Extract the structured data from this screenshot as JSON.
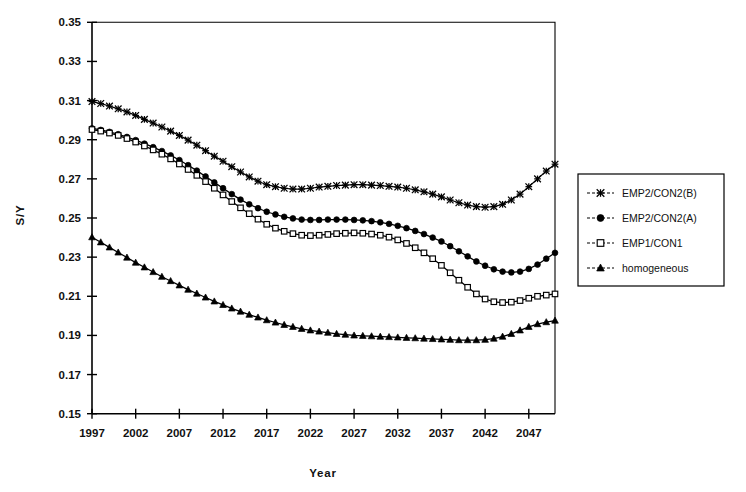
{
  "chart_data": {
    "type": "line",
    "title": "",
    "xlabel": "Year",
    "ylabel": "S/Y",
    "xlim": [
      1997,
      2050
    ],
    "ylim": [
      0.15,
      0.35
    ],
    "ytick_step": 0.02,
    "xtick_step": 5,
    "grid": false,
    "legend_position": "right",
    "xticks": [
      1997,
      2002,
      2007,
      2012,
      2017,
      2022,
      2027,
      2032,
      2037,
      2042,
      2047
    ],
    "xtick_labels": [
      "1997",
      "2002",
      "2007",
      "2012",
      "2017",
      "2022",
      "2027",
      "2032",
      "2037",
      "2042",
      "2047"
    ],
    "yticks": [
      0.15,
      0.17,
      0.19,
      0.21,
      0.23,
      0.25,
      0.27,
      0.29,
      0.31,
      0.33,
      0.35
    ],
    "ytick_labels": [
      "0.15",
      "0.17",
      "0.19",
      "0.21",
      "0.23",
      "0.25",
      "0.27",
      "0.29",
      "0.31",
      "0.33",
      "0.35"
    ],
    "x": [
      1997,
      1998,
      1999,
      2000,
      2001,
      2002,
      2003,
      2004,
      2005,
      2006,
      2007,
      2008,
      2009,
      2010,
      2011,
      2012,
      2013,
      2014,
      2015,
      2016,
      2017,
      2018,
      2019,
      2020,
      2021,
      2022,
      2023,
      2024,
      2025,
      2026,
      2027,
      2028,
      2029,
      2030,
      2031,
      2032,
      2033,
      2034,
      2035,
      2036,
      2037,
      2038,
      2039,
      2040,
      2041,
      2042,
      2043,
      2044,
      2045,
      2046,
      2047,
      2048,
      2049,
      2050
    ],
    "series": [
      {
        "name": "EMP2/CON2(B)",
        "marker": "cross",
        "values": [
          0.3095,
          0.3085,
          0.3072,
          0.3058,
          0.3042,
          0.3024,
          0.3004,
          0.2985,
          0.2965,
          0.2944,
          0.2922,
          0.2898,
          0.2872,
          0.2844,
          0.2816,
          0.279,
          0.2762,
          0.2735,
          0.271,
          0.2688,
          0.267,
          0.266,
          0.2652,
          0.2648,
          0.2648,
          0.2652,
          0.2658,
          0.2662,
          0.2666,
          0.2668,
          0.267,
          0.267,
          0.2668,
          0.2666,
          0.2662,
          0.2658,
          0.2652,
          0.2644,
          0.2634,
          0.2622,
          0.2608,
          0.2592,
          0.2578,
          0.2566,
          0.2558,
          0.2555,
          0.2558,
          0.257,
          0.2592,
          0.2622,
          0.266,
          0.27,
          0.274,
          0.2775
        ]
      },
      {
        "name": "EMP2/CON2(A)",
        "marker": "circle",
        "values": [
          0.2958,
          0.295,
          0.294,
          0.2928,
          0.2914,
          0.2898,
          0.288,
          0.2862,
          0.2842,
          0.282,
          0.2796,
          0.277,
          0.2742,
          0.2712,
          0.2682,
          0.2652,
          0.2622,
          0.2594,
          0.257,
          0.255,
          0.2532,
          0.2518,
          0.2506,
          0.2498,
          0.2492,
          0.249,
          0.249,
          0.2492,
          0.2492,
          0.2492,
          0.249,
          0.2488,
          0.2484,
          0.2478,
          0.247,
          0.246,
          0.2448,
          0.2434,
          0.2418,
          0.24,
          0.238,
          0.2356,
          0.233,
          0.2304,
          0.2278,
          0.2256,
          0.2238,
          0.2226,
          0.2222,
          0.2226,
          0.224,
          0.2262,
          0.2292,
          0.2322
        ]
      },
      {
        "name": "EMP1/CON1",
        "marker": "square",
        "values": [
          0.2952,
          0.2944,
          0.2934,
          0.2922,
          0.2906,
          0.2888,
          0.2868,
          0.2848,
          0.2826,
          0.2802,
          0.2776,
          0.2748,
          0.2718,
          0.2686,
          0.2652,
          0.2618,
          0.2584,
          0.2552,
          0.2522,
          0.2494,
          0.2468,
          0.2448,
          0.2432,
          0.242,
          0.2412,
          0.241,
          0.2412,
          0.2416,
          0.242,
          0.2422,
          0.2424,
          0.2422,
          0.2418,
          0.2412,
          0.2402,
          0.2388,
          0.237,
          0.2348,
          0.2322,
          0.2292,
          0.2258,
          0.222,
          0.2182,
          0.2146,
          0.2112,
          0.2086,
          0.2072,
          0.2068,
          0.207,
          0.2078,
          0.209,
          0.21,
          0.2106,
          0.2112
        ]
      },
      {
        "name": "homogeneous",
        "marker": "triangle",
        "values": [
          0.2402,
          0.2376,
          0.235,
          0.2324,
          0.2298,
          0.2272,
          0.2248,
          0.2224,
          0.22,
          0.2178,
          0.2156,
          0.2134,
          0.2114,
          0.2094,
          0.2074,
          0.2056,
          0.2038,
          0.2022,
          0.2006,
          0.1992,
          0.1978,
          0.1966,
          0.1954,
          0.1944,
          0.1934,
          0.1926,
          0.192,
          0.1914,
          0.1908,
          0.1904,
          0.19,
          0.1898,
          0.1896,
          0.1894,
          0.1892,
          0.189,
          0.1888,
          0.1886,
          0.1884,
          0.1882,
          0.188,
          0.1878,
          0.1876,
          0.1876,
          0.1876,
          0.1878,
          0.1884,
          0.1894,
          0.1908,
          0.1926,
          0.1944,
          0.1958,
          0.1968,
          0.1976
        ]
      }
    ]
  },
  "legend": {
    "items": [
      {
        "label": "EMP2/CON2(B)",
        "marker": "cross-marker"
      },
      {
        "label": "EMP2/CON2(A)",
        "marker": "filled-circle-marker"
      },
      {
        "label": "EMP1/CON1",
        "marker": "open-square-marker"
      },
      {
        "label": "homogeneous",
        "marker": "filled-triangle-marker"
      }
    ]
  },
  "colors": {
    "ink": "#000000",
    "background": "#ffffff"
  }
}
